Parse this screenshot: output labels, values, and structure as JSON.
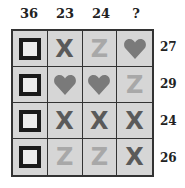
{
  "column_totals": [
    "36",
    "23",
    "24",
    "?"
  ],
  "row_totals": [
    "27",
    "29",
    "24",
    "26"
  ],
  "grid": [
    [
      "square",
      "x",
      "z",
      "heart"
    ],
    [
      "square",
      "heart",
      "heart",
      "z"
    ],
    [
      "square",
      "x",
      "x",
      "x"
    ],
    [
      "square",
      "z",
      "z",
      "x"
    ]
  ],
  "symbols": {
    "x": "X",
    "z": "Z"
  },
  "colors": {
    "cell_bg": "#d6d6d6",
    "square_border": "#1a1a1a",
    "x_color": "#5a5a5a",
    "z_color": "#a8a8a8",
    "heart_color": "#7a7a7a"
  }
}
